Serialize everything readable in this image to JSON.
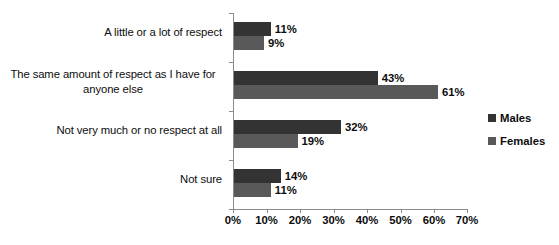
{
  "chart_data": {
    "type": "bar",
    "orientation": "horizontal",
    "title": "",
    "xlabel": "",
    "ylabel": "",
    "xlim": [
      0,
      70
    ],
    "xunit": "%",
    "grid": false,
    "legend_position": "right",
    "xticks": [
      "0%",
      "10%",
      "20%",
      "30%",
      "40%",
      "50%",
      "60%",
      "70%"
    ],
    "xtick_values": [
      0,
      10,
      20,
      30,
      40,
      50,
      60,
      70
    ],
    "categories": [
      "A little or a lot of respect",
      "The same amount of respect as I have for anyone else",
      "Not very much or no respect at all",
      "Not sure"
    ],
    "category_lines": [
      [
        "A little or a lot of respect"
      ],
      [
        "The same amount of respect as I have for",
        "anyone else"
      ],
      [
        "Not very much or no respect at all"
      ],
      [
        "Not sure"
      ]
    ],
    "series": [
      {
        "name": "Males",
        "color": "#333333",
        "values": [
          11,
          43,
          32,
          14
        ],
        "labels": [
          "11%",
          "43%",
          "32%",
          "14%"
        ]
      },
      {
        "name": "Females",
        "color": "#595959",
        "values": [
          9,
          61,
          19,
          11
        ],
        "labels": [
          "9%",
          "61%",
          "19%",
          "11%"
        ]
      }
    ]
  },
  "legend": {
    "items": [
      {
        "label": "Males",
        "color": "#333333"
      },
      {
        "label": "Females",
        "color": "#595959"
      }
    ]
  },
  "axis": {
    "line_color": "#8c8c8c"
  }
}
